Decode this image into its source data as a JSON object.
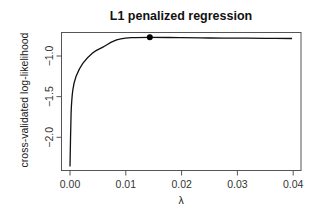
{
  "chart_data": {
    "type": "line",
    "title": "L1 penalized regression",
    "xlabel": "λ",
    "ylabel": "cross-validated log-likelihood",
    "xlim": [
      -0.0016,
      0.0415
    ],
    "ylim": [
      -2.41,
      -0.74
    ],
    "x_ticks": [
      0.0,
      0.01,
      0.02,
      0.03,
      0.04
    ],
    "x_tick_labels": [
      "0.00",
      "0.01",
      "0.02",
      "0.03",
      "0.04"
    ],
    "y_ticks": [
      -1.0,
      -1.5,
      -2.0
    ],
    "y_tick_labels": [
      "-1.0",
      "-1.5",
      "-2.0"
    ],
    "grid": false,
    "legend": null,
    "series": [
      {
        "name": "cross-validated log-likelihood",
        "x": [
          0.0,
          0.0002,
          0.0005,
          0.0011,
          0.0023,
          0.0041,
          0.0059,
          0.0077,
          0.0091,
          0.011,
          0.0143,
          0.02,
          0.025,
          0.03,
          0.035,
          0.0398
        ],
        "y": [
          -2.36,
          -1.7,
          -1.42,
          -1.25,
          -1.09,
          -0.96,
          -0.89,
          -0.82,
          -0.79,
          -0.775,
          -0.77,
          -0.775,
          -0.778,
          -0.78,
          -0.782,
          -0.785
        ]
      }
    ],
    "annotations": [
      {
        "type": "point",
        "label": "maximum",
        "x": 0.0143,
        "y": -0.77
      }
    ]
  }
}
